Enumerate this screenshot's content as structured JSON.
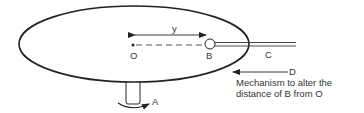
{
  "diagram": {
    "type": "rotating turntable mechanism",
    "labels": {
      "O": "O",
      "B": "B",
      "C": "C",
      "D": "D",
      "A": "A",
      "y": "y"
    },
    "caption": {
      "line1": "Mechanism to alter the",
      "line2": "distance of B from O"
    },
    "colors": {
      "stroke": "#222222",
      "text": "#333333",
      "background": "#ffffff"
    }
  }
}
